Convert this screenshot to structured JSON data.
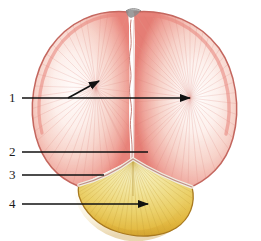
{
  "figure": {
    "background_color": "#ffffff",
    "width": 261,
    "height": 241
  },
  "labels": [
    {
      "id": "1",
      "text": "1",
      "x": 9,
      "y": 91,
      "target": "parietal-bone"
    },
    {
      "id": "2",
      "text": "2",
      "x": 9,
      "y": 145,
      "target": "lambda-suture-junction"
    },
    {
      "id": "3",
      "text": "3",
      "x": 9,
      "y": 168,
      "target": "lambdoid-suture"
    },
    {
      "id": "4",
      "text": "4",
      "x": 9,
      "y": 197,
      "target": "occipital-bone"
    }
  ],
  "leader_lines": [
    {
      "id": "leader-1",
      "label": "1",
      "color": "#111111",
      "width": 1.6,
      "segments": [
        {
          "x1": 22,
          "y1": 98,
          "x2": 190,
          "y2": 98
        },
        {
          "x1": 68,
          "y1": 98,
          "x2": 99,
          "y2": 81
        }
      ],
      "arrowheads": [
        {
          "x": 190,
          "y": 98,
          "angle": 0
        },
        {
          "x": 99,
          "y": 81,
          "angle": -29
        }
      ]
    },
    {
      "id": "leader-2",
      "label": "2",
      "color": "#111111",
      "width": 1.6,
      "segments": [
        {
          "x1": 22,
          "y1": 152,
          "x2": 148,
          "y2": 152
        }
      ],
      "arrowheads": []
    },
    {
      "id": "leader-3",
      "label": "3",
      "color": "#111111",
      "width": 1.6,
      "segments": [
        {
          "x1": 22,
          "y1": 175,
          "x2": 104,
          "y2": 175
        }
      ],
      "arrowheads": []
    },
    {
      "id": "leader-4",
      "label": "4",
      "color": "#111111",
      "width": 1.6,
      "segments": [
        {
          "x1": 22,
          "y1": 204,
          "x2": 148,
          "y2": 204
        }
      ],
      "arrowheads": [
        {
          "x": 148,
          "y": 204,
          "angle": 0
        }
      ]
    }
  ],
  "colors": {
    "parietal_fill_light": "#fdf4f2",
    "parietal_fill_mid": "#f6c9c0",
    "parietal_edge": "#e8837a",
    "parietal_outline": "#c4675f",
    "occipital_fill_light": "#f6eeb4",
    "occipital_fill_mid": "#e8c95a",
    "occipital_edge": "#d9a52f",
    "occipital_outline": "#a8791f",
    "suture_line": "#c9837c",
    "fontanelle_grey": "#8c8c8c",
    "label_text": "#1a1a1a",
    "leader_line": "#111111",
    "background": "#ffffff"
  },
  "structures": [
    {
      "name": "left-parietal-bone",
      "region": "upper-left",
      "color": "#f6c9c0"
    },
    {
      "name": "right-parietal-bone",
      "region": "upper-right",
      "color": "#f6c9c0"
    },
    {
      "name": "sagittal-suture",
      "region": "center-vertical",
      "color": "#c9837c"
    },
    {
      "name": "lambdoid-suture",
      "region": "lower-v-shape",
      "color": "#c9837c"
    },
    {
      "name": "occipital-bone",
      "region": "bottom",
      "color": "#e8c95a"
    },
    {
      "name": "posterior-fontanelle",
      "region": "top-center",
      "color": "#8c8c8c"
    }
  ]
}
